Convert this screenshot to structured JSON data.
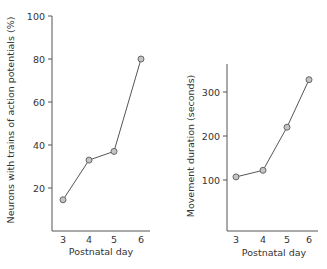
{
  "chart_data": [
    {
      "type": "line",
      "title": "",
      "xlabel": "Postnatal day",
      "ylabel": "Neurons with trains of action potentials (%)",
      "x": [
        3,
        4,
        5,
        6
      ],
      "xticks": [
        "3",
        "4",
        "5",
        "6"
      ],
      "values": [
        14.5,
        33,
        37,
        80
      ],
      "ylim": [
        0,
        100
      ],
      "yticks": [
        20,
        40,
        60,
        80,
        100
      ],
      "yticks_labels": [
        "20",
        "40",
        "60",
        "80",
        "100"
      ],
      "grid": false,
      "legend": "none",
      "marker": "circle"
    },
    {
      "type": "line",
      "title": "",
      "xlabel": "Postnatal day",
      "ylabel": "Movement duration (seconds)",
      "x": [
        3,
        4,
        5,
        6
      ],
      "xticks": [
        "3",
        "4",
        "5",
        "6"
      ],
      "values": [
        107,
        122,
        220,
        328
      ],
      "ylim": [
        0,
        370
      ],
      "yticks": [
        100,
        200,
        300
      ],
      "yticks_labels": [
        "100",
        "200",
        "300"
      ],
      "grid": false,
      "legend": "none",
      "marker": "circle"
    }
  ],
  "colors": {
    "line": "#555555",
    "marker_fill": "#c4c4c4",
    "text": "#333333"
  }
}
